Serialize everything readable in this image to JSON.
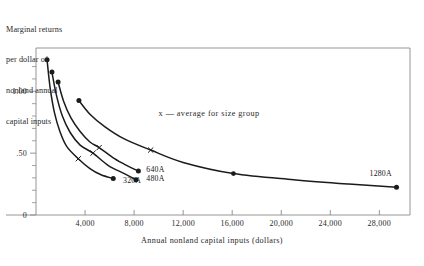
{
  "figure": {
    "y_axis_caption_lines": [
      "Marginal returns",
      "per dollar of",
      "nonland annual",
      "capital inputs"
    ],
    "x_axis_title": "Annual nonland capital inputs (dollars)",
    "legend_note": "x — average for size group",
    "y_tick_labels": [
      "1.00",
      ".50",
      "0"
    ],
    "x_tick_labels": [
      "4,000",
      "8,000",
      "12,000",
      "16,000",
      "20,000",
      "24,000",
      "28,000"
    ],
    "series_labels": [
      "320A",
      "480A",
      "640A",
      "1280A"
    ],
    "colors": {
      "ink": "#1b1b1b",
      "frame": "#8a8a8a",
      "background": "#ffffff"
    }
  },
  "chart_data": {
    "type": "line",
    "title": "",
    "subtitle": "",
    "xlabel": "Annual nonland capital inputs (dollars)",
    "ylabel": "Marginal returns per dollar of nonland annual capital inputs",
    "xlim": [
      0,
      30500
    ],
    "ylim": [
      0,
      1.35
    ],
    "xticks": [
      4000,
      8000,
      12000,
      16000,
      20000,
      24000,
      28000
    ],
    "xtick_labels": [
      "4,000",
      "8,000",
      "12,000",
      "16,000",
      "20,000",
      "24,000",
      "28,000"
    ],
    "yticks": [
      0,
      0.5,
      1.0
    ],
    "ytick_labels": [
      "0",
      ".50",
      "1.00"
    ],
    "yminor_ticks": [
      0.1,
      0.2,
      0.3,
      0.4,
      0.6,
      0.7,
      0.8,
      0.9,
      1.1,
      1.2
    ],
    "grid": false,
    "legend": "annotation-in-plot",
    "legend_position": "upper-center",
    "annotations": [
      {
        "text": "x — average for size group",
        "x": 10000,
        "y": 0.8
      },
      {
        "text": "320A",
        "x": 7100,
        "y": 0.255
      },
      {
        "text": "480A",
        "x": 9000,
        "y": 0.275
      },
      {
        "text": "640A",
        "x": 9000,
        "y": 0.345
      },
      {
        "text": "1280A",
        "x": 27200,
        "y": 0.315
      }
    ],
    "series": [
      {
        "name": "320A",
        "endpoint_marker": "filled-circle",
        "average_marker": "x",
        "average_point": {
          "x": 3450,
          "y": 0.455
        },
        "points": [
          {
            "x": 900,
            "y": 1.255
          },
          {
            "x": 1150,
            "y": 1.03
          },
          {
            "x": 1500,
            "y": 0.83
          },
          {
            "x": 1950,
            "y": 0.675
          },
          {
            "x": 2500,
            "y": 0.555
          },
          {
            "x": 3450,
            "y": 0.455
          },
          {
            "x": 4400,
            "y": 0.375
          },
          {
            "x": 5300,
            "y": 0.325
          },
          {
            "x": 6300,
            "y": 0.295
          }
        ]
      },
      {
        "name": "480A",
        "endpoint_marker": "filled-circle",
        "average_marker": "x",
        "average_point": {
          "x": 4650,
          "y": 0.5
        },
        "points": [
          {
            "x": 1300,
            "y": 1.155
          },
          {
            "x": 1650,
            "y": 0.975
          },
          {
            "x": 2150,
            "y": 0.8
          },
          {
            "x": 2800,
            "y": 0.665
          },
          {
            "x": 3600,
            "y": 0.565
          },
          {
            "x": 4650,
            "y": 0.5
          },
          {
            "x": 5900,
            "y": 0.4
          },
          {
            "x": 7200,
            "y": 0.335
          },
          {
            "x": 8150,
            "y": 0.285
          }
        ]
      },
      {
        "name": "640A",
        "endpoint_marker": "filled-circle",
        "average_marker": "x",
        "average_point": {
          "x": 5150,
          "y": 0.545
        },
        "points": [
          {
            "x": 1800,
            "y": 1.075
          },
          {
            "x": 2250,
            "y": 0.92
          },
          {
            "x": 2850,
            "y": 0.785
          },
          {
            "x": 3600,
            "y": 0.675
          },
          {
            "x": 4400,
            "y": 0.59
          },
          {
            "x": 5150,
            "y": 0.545
          },
          {
            "x": 6400,
            "y": 0.455
          },
          {
            "x": 7500,
            "y": 0.395
          },
          {
            "x": 8350,
            "y": 0.355
          }
        ]
      },
      {
        "name": "1280A",
        "endpoint_marker": "filled-circle",
        "average_marker": "x",
        "average_point": {
          "x": 9350,
          "y": 0.525
        },
        "points": [
          {
            "x": 3500,
            "y": 0.925
          },
          {
            "x": 4400,
            "y": 0.815
          },
          {
            "x": 5600,
            "y": 0.715
          },
          {
            "x": 7200,
            "y": 0.615
          },
          {
            "x": 9350,
            "y": 0.525
          },
          {
            "x": 12000,
            "y": 0.425
          },
          {
            "x": 16100,
            "y": 0.335
          },
          {
            "x": 21000,
            "y": 0.285
          },
          {
            "x": 25500,
            "y": 0.25
          },
          {
            "x": 29400,
            "y": 0.225
          }
        ]
      }
    ],
    "midpoint_markers": [
      {
        "series": "1280A",
        "x": 16100,
        "y": 0.335,
        "marker": "filled-circle"
      }
    ]
  }
}
